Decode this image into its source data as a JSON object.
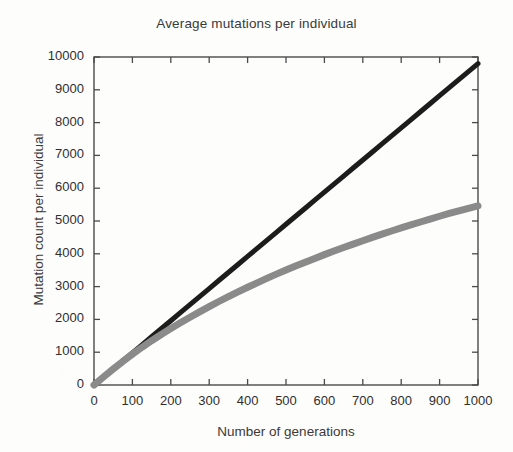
{
  "chart_data": {
    "type": "line",
    "title": "Average mutations per individual",
    "xlabel": "Number of generations",
    "ylabel": "Mutation count per individual",
    "xlim": [
      0,
      1000
    ],
    "ylim": [
      0,
      10000
    ],
    "xticks": [
      0,
      100,
      200,
      300,
      400,
      500,
      600,
      700,
      800,
      900,
      1000
    ],
    "yticks": [
      0,
      1000,
      2000,
      3000,
      4000,
      5000,
      6000,
      7000,
      8000,
      9000,
      10000
    ],
    "xtick_labels": [
      "0",
      "100",
      "200",
      "300",
      "400",
      "500",
      "600",
      "700",
      "800",
      "900",
      "1000"
    ],
    "ytick_labels": [
      "0",
      "1000",
      "2000",
      "3000",
      "4000",
      "5000",
      "6000",
      "7000",
      "8000",
      "9000",
      "10000"
    ],
    "grid": false,
    "legend": "none",
    "x": [
      0,
      25,
      50,
      75,
      100,
      125,
      150,
      175,
      200,
      225,
      250,
      275,
      300,
      325,
      350,
      375,
      400,
      425,
      450,
      475,
      500,
      525,
      550,
      575,
      600,
      625,
      650,
      675,
      700,
      725,
      750,
      775,
      800,
      825,
      850,
      875,
      900,
      925,
      950,
      975,
      1000
    ],
    "series": [
      {
        "name": "linear-accumulation",
        "color": "#1c1c1c",
        "linewidth": 5,
        "values": [
          0,
          245,
          490,
          735,
          980,
          1225,
          1470,
          1715,
          1960,
          2205,
          2450,
          2695,
          2940,
          3185,
          3430,
          3675,
          3920,
          4165,
          4410,
          4655,
          4900,
          5145,
          5390,
          5635,
          5880,
          6125,
          6370,
          6615,
          6860,
          7105,
          7350,
          7595,
          7840,
          8085,
          8330,
          8575,
          8820,
          9065,
          9310,
          9555,
          9800
        ]
      },
      {
        "name": "saturating-accumulation",
        "color": "#8a8a8a",
        "linewidth": 7,
        "values": [
          0,
          250,
          490,
          720,
          940,
          1150,
          1350,
          1540,
          1720,
          1895,
          2065,
          2230,
          2390,
          2545,
          2695,
          2840,
          2980,
          3115,
          3250,
          3380,
          3505,
          3625,
          3745,
          3860,
          3975,
          4085,
          4190,
          4295,
          4400,
          4500,
          4600,
          4695,
          4790,
          4880,
          4970,
          5060,
          5145,
          5230,
          5310,
          5385,
          5460
        ]
      }
    ]
  },
  "figure": {
    "background_color": "#fdfdfc",
    "axis_color": "#4a4a4a",
    "text_color": "#2f2f2f"
  }
}
